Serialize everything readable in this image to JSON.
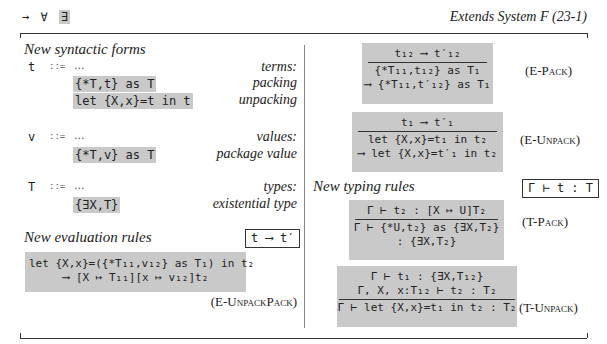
{
  "header": {
    "nav_symbols": [
      "→",
      "∀",
      "∃"
    ],
    "active_symbol_index": 2,
    "title": "Extends System F (23-1)"
  },
  "syntax": {
    "heading": "New syntactic forms",
    "groups": [
      {
        "metavar": "t",
        "defsym": "::=",
        "ellipsis": "...",
        "category": "terms:",
        "forms": [
          {
            "code": "{*T,t} as T",
            "desc": "packing"
          },
          {
            "code": "let {X,x}=t in t",
            "desc": "unpacking"
          }
        ]
      },
      {
        "metavar": "v",
        "defsym": "::=",
        "ellipsis": "...",
        "category": "values:",
        "forms": [
          {
            "code": "{*T,v} as T",
            "desc": "package value"
          }
        ]
      },
      {
        "metavar": "T",
        "defsym": "::=",
        "ellipsis": "...",
        "category": "types:",
        "forms": [
          {
            "code": "{∃X,T}",
            "desc": "existential type"
          }
        ]
      }
    ]
  },
  "evaluation": {
    "heading": "New evaluation rules",
    "judgment": "t ⟶ t′",
    "rules": [
      {
        "name": "(E-UnpackPack)",
        "premises": [],
        "conclusion": [
          "let {X,x}=({*T₁₁,v₁₂} as T₁) in t₂",
          "⟶ [X ↦ T₁₁][x ↦ v₁₂]t₂"
        ]
      },
      {
        "name": "(E-Pack)",
        "premises": [
          "t₁₂ ⟶ t′₁₂"
        ],
        "conclusion": [
          "{*T₁₁,t₁₂} as T₁",
          "⟶ {*T₁₁,t′₁₂} as T₁"
        ]
      },
      {
        "name": "(E-Unpack)",
        "premises": [
          "t₁ ⟶ t′₁"
        ],
        "conclusion": [
          "let {X,x}=t₁ in t₂",
          "⟶ let {X,x}=t′₁ in t₂"
        ]
      }
    ]
  },
  "typing": {
    "heading": "New typing rules",
    "judgment": "Γ ⊢ t : T",
    "rules": [
      {
        "name": "(T-Pack)",
        "premises": [
          "Γ ⊢ t₂ : [X ↦ U]T₂"
        ],
        "conclusion": [
          "Γ ⊢ {*U,t₂} as {∃X,T₂}",
          ": {∃X,T₂}"
        ]
      },
      {
        "name": "(T-Unpack)",
        "premises": [
          "Γ ⊢ t₁ : {∃X,T₁₂}",
          "Γ, X, x:T₁₂ ⊢ t₂ : T₂"
        ],
        "conclusion": [
          "Γ ⊢ let {X,x}=t₁ in t₂ : T₂"
        ]
      }
    ]
  }
}
